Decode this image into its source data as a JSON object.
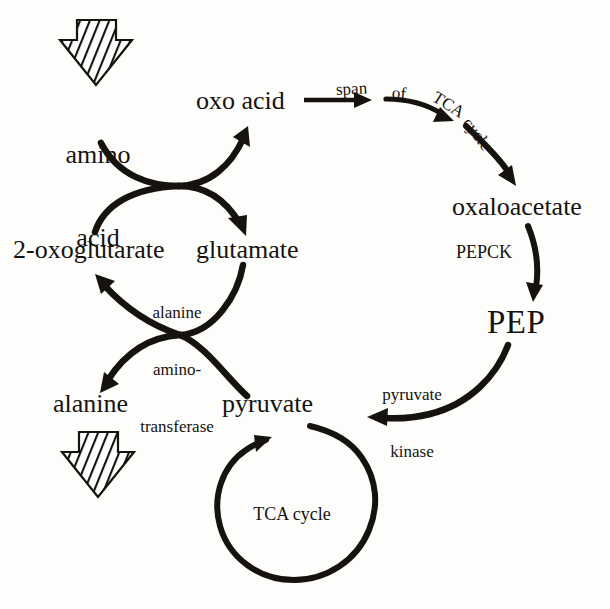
{
  "diagram": {
    "background_color": "#fdfdfc",
    "ink_color": "#16130f",
    "metabolites": {
      "amino_acid_line1": "amino",
      "amino_acid_line2": "acid",
      "oxo_acid": "oxo acid",
      "oxoglutarate": "2-oxoglutarate",
      "glutamate": "glutamate",
      "alanine": "alanine",
      "pyruvate": "pyruvate",
      "oxaloacetate": "oxaloacetate",
      "pep": "PEP"
    },
    "enzymes": {
      "alanine_aminotransferase_line1": "alanine",
      "alanine_aminotransferase_line2": "amino-",
      "alanine_aminotransferase_line3": "transferase",
      "pepck": "PEPCK",
      "pyruvate_kinase_line1": "pyruvate",
      "pyruvate_kinase_line2": "kinase"
    },
    "annotations": {
      "span_of_tca_cycle": [
        "span",
        "of",
        "TCA",
        "cycle"
      ],
      "tca_cycle_loop": "TCA cycle"
    },
    "input_arrow_label": "amino acid input block arrow",
    "output_arrow_label": "alanine output block arrow"
  }
}
